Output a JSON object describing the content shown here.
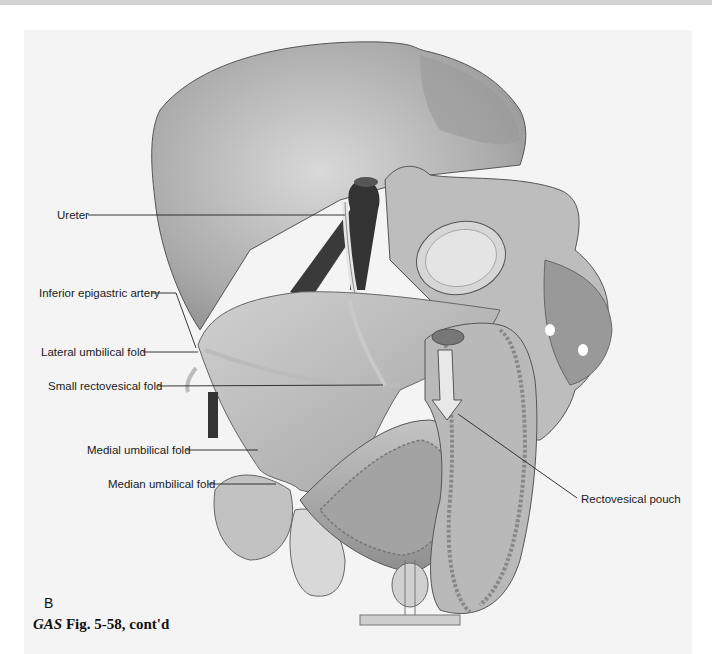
{
  "figure": {
    "panel_letter": "B",
    "caption_prefix": "GAS",
    "caption_text": " Fig. 5-58, cont'd"
  },
  "labels": [
    {
      "id": "ureter",
      "text": "Ureter"
    },
    {
      "id": "inferior-epigastric-artery",
      "text": "Inferior epigastric artery"
    },
    {
      "id": "lateral-umbilical-fold",
      "text": "Lateral umbilical fold"
    },
    {
      "id": "small-rectovesical-fold",
      "text": "Small rectovesical fold"
    },
    {
      "id": "medial-umbilical-fold",
      "text": "Medial umbilical fold"
    },
    {
      "id": "median-umbilical-fold",
      "text": "Median umbilical fold"
    },
    {
      "id": "rectovesical-pouch",
      "text": "Rectovesical pouch"
    }
  ],
  "colors": {
    "background": "#ffffff",
    "panel": "#f4f4f4",
    "top_bar": "#d2d2d2",
    "bone": "#c8c8c8",
    "tissue": "#b5b5b5",
    "vessel": "#3a3a3a",
    "leader_line": "#222222"
  }
}
